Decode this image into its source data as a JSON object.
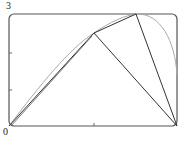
{
  "diagram": {
    "axis_labels": {
      "y_top": "3",
      "origin": "0"
    },
    "frame": {
      "x": 9,
      "y": 14,
      "w": 168,
      "h": 112,
      "rx": 5,
      "color": "#444444"
    },
    "ticks": {
      "left_y": [
        53,
        90
      ],
      "bottom_x": [
        94
      ]
    },
    "points": {
      "origin": [
        9,
        126
      ],
      "A": [
        94,
        33
      ],
      "B": [
        136,
        14
      ],
      "C": [
        177,
        126
      ]
    },
    "segments": [
      {
        "from": "origin",
        "to": "A",
        "color": "#333333"
      },
      {
        "from": "A",
        "to": "B",
        "color": "#333333"
      },
      {
        "from": "B",
        "to": "C",
        "color": "#333333"
      },
      {
        "from": "A",
        "to": "C",
        "color": "#333333"
      }
    ],
    "curve_color": "#aaaaaa"
  }
}
